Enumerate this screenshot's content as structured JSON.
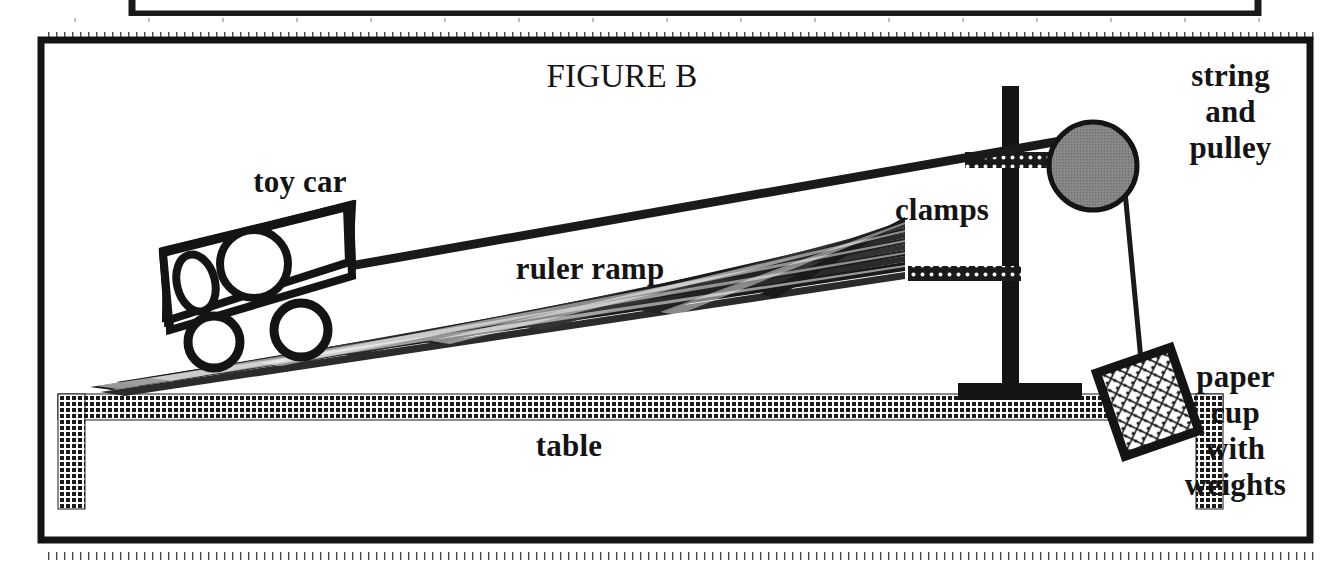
{
  "figure": {
    "title": "FIGURE B",
    "background_color": "#ffffff",
    "ink_color": "#141414",
    "pulley_fill_color": "#808080",
    "border_color": "#141414"
  },
  "labels": {
    "title": "FIGURE B",
    "toy_car": "toy car",
    "ruler_ramp": "ruler ramp",
    "clamps": "clamps",
    "table": "table",
    "string_and_pulley": "string\nand\npulley",
    "paper_cup_with_weights": "paper\ncup\nwith\nweights"
  },
  "parts": [
    {
      "name": "toy-car",
      "label": "toy car"
    },
    {
      "name": "ruler-ramp",
      "label": "ruler ramp"
    },
    {
      "name": "clamps",
      "label": "clamps"
    },
    {
      "name": "table",
      "label": "table"
    },
    {
      "name": "string-and-pulley",
      "label": "string and pulley"
    },
    {
      "name": "paper-cup-with-weights",
      "label": "paper cup with weights"
    },
    {
      "name": "ring-stand",
      "label": "ring stand"
    }
  ],
  "page_marks": {
    "top_partial_box": "partial box above figure",
    "ruler_tick_strip": "dotted ruler tick strip",
    "bottom_tick_strip": "dotted ruler tick strip"
  }
}
